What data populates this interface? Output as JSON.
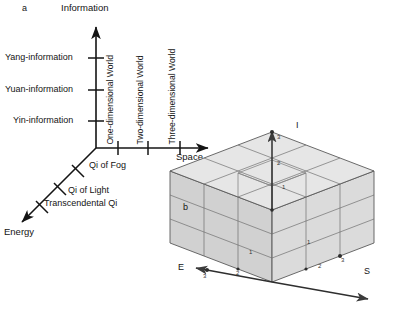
{
  "figure": {
    "background": "#ffffff",
    "ink": "#141414",
    "panels": [
      {
        "id": "a",
        "letter": "a"
      },
      {
        "id": "b",
        "letter": "b"
      }
    ]
  },
  "panel_a": {
    "letter": "a",
    "axes": [
      {
        "name": "information-axis",
        "label": "Information",
        "direction": "up"
      },
      {
        "name": "space-axis",
        "label": "Space",
        "direction": "right"
      },
      {
        "name": "energy-axis",
        "label": "Energy",
        "direction": "down-left"
      }
    ],
    "information_ticks": [
      {
        "label": "Yang-information"
      },
      {
        "label": "Yuan-information"
      },
      {
        "label": "Yin-information"
      }
    ],
    "space_ticks": [
      {
        "label": "One-dimensional World"
      },
      {
        "label": "Two-dimensional World"
      },
      {
        "label": "Three-dimensional World"
      }
    ],
    "energy_ticks": [
      {
        "label": "Qi of Fog"
      },
      {
        "label": "Qi of Light"
      },
      {
        "label": "Transcendental Qi"
      }
    ]
  },
  "panel_b": {
    "letter": "b",
    "axes": [
      {
        "name": "i-axis",
        "label": "I",
        "direction": "up"
      },
      {
        "name": "s-axis",
        "label": "S",
        "direction": "down-right"
      },
      {
        "name": "e-axis",
        "label": "E",
        "direction": "down-left"
      }
    ],
    "cube": {
      "divisions": 3,
      "fill": "#d8d8d8",
      "edge": "#555555"
    },
    "axis_marks": [
      {
        "axis": "I",
        "value": "3"
      },
      {
        "axis": "I",
        "value": "2"
      },
      {
        "axis": "I",
        "value": "1"
      },
      {
        "axis": "E",
        "value": "3"
      },
      {
        "axis": "E",
        "value": "2"
      },
      {
        "axis": "E",
        "value": "1"
      },
      {
        "axis": "S",
        "value": "1"
      },
      {
        "axis": "S",
        "value": "2"
      },
      {
        "axis": "S",
        "value": "3"
      }
    ]
  }
}
